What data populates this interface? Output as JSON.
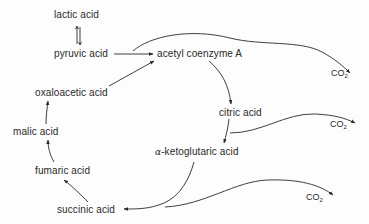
{
  "diagram": {
    "type": "metabolic-pathway",
    "nodes": {
      "lactic_acid": "lactic acid",
      "pyruvic_acid": "pyruvic acid",
      "acetyl_coa": "acetyl coenzyme A",
      "oxaloacetic_acid": "oxaloacetic acid",
      "malic_acid": "malic acid",
      "fumaric_acid": "fumaric acid",
      "succinic_acid": "succinic acid",
      "citric_acid": "citric acid",
      "alpha_prefix": "α",
      "ketoglutaric_suffix": "-ketoglutaric acid"
    },
    "co2": {
      "base": "CO",
      "subscript": "2"
    },
    "edges": [
      {
        "from": "lactic acid",
        "to": "pyruvic acid",
        "style": "reversible"
      },
      {
        "from": "pyruvic acid",
        "to": "acetyl coenzyme A"
      },
      {
        "from": "pyruvic acid",
        "to": "CO2"
      },
      {
        "from": "oxaloacetic acid",
        "to": "acetyl coenzyme A"
      },
      {
        "from": "acetyl coenzyme A",
        "to": "citric acid"
      },
      {
        "from": "citric acid",
        "to": "α-ketoglutaric acid"
      },
      {
        "from": "citric acid",
        "to": "CO2"
      },
      {
        "from": "α-ketoglutaric acid",
        "to": "succinic acid"
      },
      {
        "from": "α-ketoglutaric acid",
        "to": "CO2"
      },
      {
        "from": "succinic acid",
        "to": "fumaric acid"
      },
      {
        "from": "fumaric acid",
        "to": "malic acid"
      },
      {
        "from": "malic acid",
        "to": "oxaloacetic acid"
      }
    ],
    "colors": {
      "ink": "#2a2a2a",
      "background": "#fdfdfd"
    }
  }
}
